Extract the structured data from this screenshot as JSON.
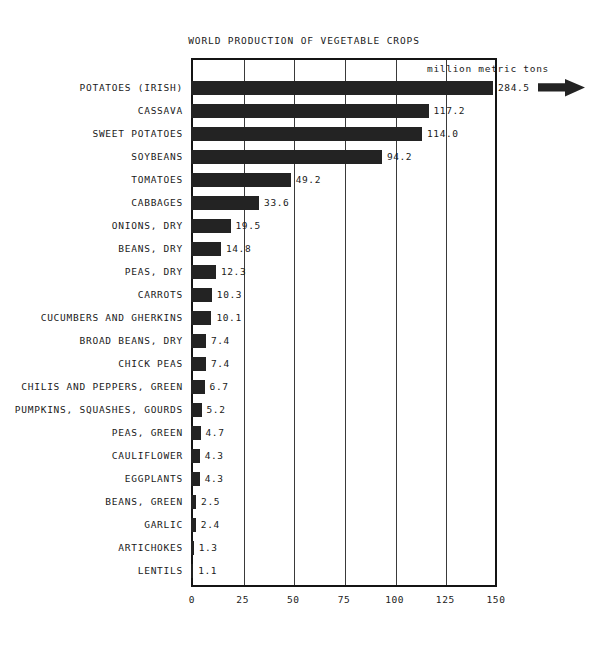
{
  "chart_data": {
    "type": "bar",
    "orientation": "horizontal",
    "title": "WORLD PRODUCTION OF VEGETABLE CROPS",
    "units_note": "million metric tons",
    "xlabel": "",
    "ylabel": "",
    "xlim": [
      0,
      150
    ],
    "xticks": [
      0,
      25,
      50,
      75,
      100,
      125,
      150
    ],
    "xtick_labels": [
      "0",
      "25",
      "50",
      "75",
      "100",
      "125",
      "150"
    ],
    "grid": true,
    "grid_axis": "x",
    "legend": false,
    "overflow_marker": "arrow-right",
    "overflow_note": "Top bar (284.5) exceeds axis maximum of 150 and is marked with a right-pointing arrow.",
    "categories": [
      "POTATOES (IRISH)",
      "CASSAVA",
      "SWEET POTATOES",
      "SOYBEANS",
      "TOMATOES",
      "CABBAGES",
      "ONIONS, DRY",
      "BEANS, DRY",
      "PEAS, DRY",
      "CARROTS",
      "CUCUMBERS AND GHERKINS",
      "BROAD BEANS, DRY",
      "CHICK PEAS",
      "CHILIS AND PEPPERS, GREEN",
      "PUMPKINS, SQUASHES, GOURDS",
      "PEAS, GREEN",
      "CAULIFLOWER",
      "EGGPLANTS",
      "BEANS, GREEN",
      "GARLIC",
      "ARTICHOKES",
      "LENTILS"
    ],
    "values": [
      284.5,
      117.2,
      114.0,
      94.2,
      49.2,
      33.6,
      19.5,
      14.8,
      12.3,
      10.3,
      10.1,
      7.4,
      7.4,
      6.7,
      5.2,
      4.7,
      4.3,
      4.3,
      2.5,
      2.4,
      1.3,
      1.1
    ],
    "value_labels": [
      "284.5",
      "117.2",
      "114.0",
      "94.2",
      "49.2",
      "33.6",
      "19.5",
      "14.8",
      "12.3",
      "10.3",
      "10.1",
      "7.4",
      "7.4",
      "6.7",
      "5.2",
      "4.7",
      "4.3",
      "4.3",
      "2.5",
      "2.4",
      "1.3",
      "1.1"
    ],
    "colors": {
      "bar": "#232323",
      "frame": "#141414",
      "grid": "#3a3a3a",
      "text": "#1a1a1a",
      "background": "#ffffff"
    }
  },
  "icons": {
    "overflow_arrow": "arrow-right-icon"
  }
}
